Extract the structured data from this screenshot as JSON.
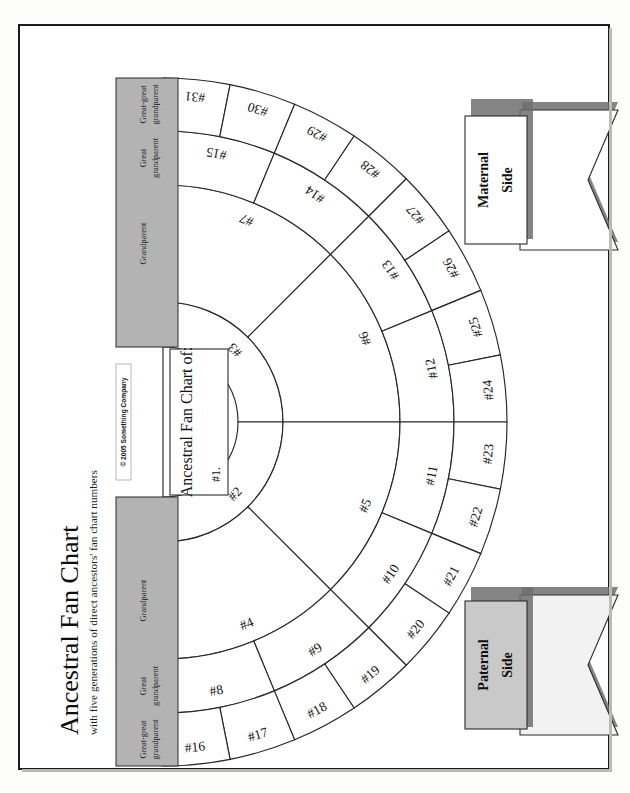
{
  "document": {
    "title": "Ancestral Fan Chart",
    "subtitle": "with five generations of direct ancestors' fan chart numbers",
    "copyright": "© 2005 Something Company"
  },
  "banners": {
    "maternal": {
      "line1": "Maternal",
      "line2": "Side",
      "fill": "#ffffff"
    },
    "paternal": {
      "line1": "Paternal",
      "line2": "Side",
      "fill": "#c9c9c9"
    }
  },
  "center": {
    "heading": "Ancestral Fan Chart of:",
    "number": "#1."
  },
  "generation_bands": {
    "fill": "#b3b3b3",
    "maternal": [
      {
        "label_line1": "Grandparent",
        "label_line2": ""
      },
      {
        "label_line1": "Great",
        "label_line2": "grandparent"
      },
      {
        "label_line1": "Great-great",
        "label_line2": "grandparent"
      }
    ],
    "paternal": [
      {
        "label_line1": "Grandparent",
        "label_line2": ""
      },
      {
        "label_line1": "Great",
        "label_line2": "grandparent"
      },
      {
        "label_line1": "Great-great",
        "label_line2": "grandparent"
      }
    ]
  },
  "chart_data": {
    "type": "fan-chart",
    "title": "Ancestral Fan Chart",
    "generations": 5,
    "orientation": "left-opening half-fan, paternal (even) on lower half, maternal (odd) on upper half",
    "rings": [
      {
        "generation": 1,
        "relation": "Self",
        "segments": [
          "#1."
        ]
      },
      {
        "generation": 2,
        "relation": "Parent",
        "segments": [
          "#2",
          "#3"
        ]
      },
      {
        "generation": 3,
        "relation": "Grandparent",
        "segments": [
          "#4",
          "#5",
          "#6",
          "#7"
        ]
      },
      {
        "generation": 4,
        "relation": "Great grandparent",
        "segments": [
          "#8",
          "#9",
          "#10",
          "#11",
          "#12",
          "#13",
          "#14",
          "#15"
        ]
      },
      {
        "generation": 5,
        "relation": "Great-great grandparent",
        "segments": [
          "#16",
          "#17",
          "#18",
          "#19",
          "#20",
          "#21",
          "#22",
          "#23",
          "#24",
          "#25",
          "#26",
          "#27",
          "#28",
          "#29",
          "#30",
          "#31"
        ]
      }
    ],
    "paternal_numbers": [
      "#2",
      "#4",
      "#5",
      "#8",
      "#9",
      "#10",
      "#11",
      "#16",
      "#17",
      "#18",
      "#19",
      "#20",
      "#21",
      "#22",
      "#23"
    ],
    "maternal_numbers": [
      "#3",
      "#6",
      "#7",
      "#12",
      "#13",
      "#14",
      "#15",
      "#24",
      "#25",
      "#26",
      "#27",
      "#28",
      "#29",
      "#30",
      "#31"
    ]
  },
  "labels": {
    "ring2": [
      "#2",
      "#3"
    ],
    "ring3": [
      "#4",
      "#5",
      "#6",
      "#7"
    ],
    "ring4": [
      "#8",
      "#9",
      "#10",
      "#11",
      "#12",
      "#13",
      "#14",
      "#15"
    ],
    "ring5": [
      "#16",
      "#17",
      "#18",
      "#19",
      "#20",
      "#21",
      "#22",
      "#23",
      "#24",
      "#25",
      "#26",
      "#27",
      "#28",
      "#29",
      "#30",
      "#31"
    ]
  }
}
